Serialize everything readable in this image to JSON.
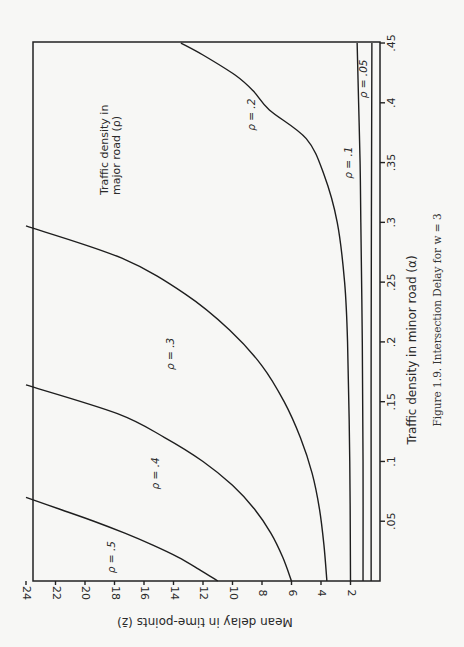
{
  "chart_data": {
    "type": "line",
    "title": "Figure 1.9. Intersection Delay for w = 3",
    "xlabel": "Traffic density in minor road (α)",
    "ylabel": "Mean delay in time-points (z̄)",
    "legend_title": "Traffic density in major road (ρ)",
    "orientation": "rotated 90° clockwise on page",
    "xlim": [
      0,
      0.45
    ],
    "ylim": [
      0,
      24
    ],
    "x_ticks": [
      ".05",
      ".1",
      ".15",
      ".2",
      ".25",
      ".3",
      ".35",
      ".4",
      ".45"
    ],
    "x_tick_values": [
      0.05,
      0.1,
      0.15,
      0.2,
      0.25,
      0.3,
      0.35,
      0.4,
      0.45
    ],
    "y_ticks": [
      "2",
      "4",
      "6",
      "8",
      "10",
      "12",
      "14",
      "16",
      "18",
      "20",
      "22",
      "24"
    ],
    "y_tick_values": [
      2,
      4,
      6,
      8,
      10,
      12,
      14,
      16,
      18,
      20,
      22,
      24
    ],
    "grid": false,
    "series": [
      {
        "name": "ρ = .5",
        "label_pos": [
          0.02,
          18
        ],
        "points": [
          [
            0,
            11.0
          ],
          [
            0.01,
            12.3
          ],
          [
            0.02,
            13.7
          ],
          [
            0.03,
            15.4
          ],
          [
            0.04,
            17.3
          ],
          [
            0.05,
            19.4
          ],
          [
            0.06,
            21.7
          ],
          [
            0.07,
            24.0
          ]
        ]
      },
      {
        "name": "ρ = .4",
        "label_pos": [
          0.09,
          15
        ],
        "points": [
          [
            0,
            6.0
          ],
          [
            0.02,
            6.6
          ],
          [
            0.04,
            7.4
          ],
          [
            0.06,
            8.5
          ],
          [
            0.08,
            10.0
          ],
          [
            0.1,
            12.0
          ],
          [
            0.12,
            14.6
          ],
          [
            0.14,
            17.8
          ],
          [
            0.164,
            24.0
          ]
        ]
      },
      {
        "name": "ρ = .3",
        "label_pos": [
          0.19,
          14
        ],
        "points": [
          [
            0,
            3.6
          ],
          [
            0.03,
            3.8
          ],
          [
            0.06,
            4.1
          ],
          [
            0.09,
            4.6
          ],
          [
            0.12,
            5.4
          ],
          [
            0.15,
            6.5
          ],
          [
            0.18,
            8.0
          ],
          [
            0.21,
            10.2
          ],
          [
            0.24,
            13.2
          ],
          [
            0.27,
            17.5
          ],
          [
            0.297,
            24.0
          ]
        ]
      },
      {
        "name": "ρ = .2",
        "label_pos": [
          0.39,
          8.5
        ],
        "points": [
          [
            0,
            2.0
          ],
          [
            0.1,
            2.05
          ],
          [
            0.2,
            2.2
          ],
          [
            0.25,
            2.4
          ],
          [
            0.3,
            2.9
          ],
          [
            0.34,
            3.8
          ],
          [
            0.37,
            5.0
          ],
          [
            0.394,
            7.5
          ],
          [
            0.41,
            8.6
          ],
          [
            0.423,
            9.8
          ],
          [
            0.44,
            12.0
          ],
          [
            0.45,
            13.5
          ]
        ]
      },
      {
        "name": "ρ = .1",
        "label_pos": [
          0.35,
          1.9
        ],
        "points": [
          [
            0,
            1.15
          ],
          [
            0.1,
            1.15
          ],
          [
            0.2,
            1.2
          ],
          [
            0.3,
            1.3
          ],
          [
            0.35,
            1.35
          ],
          [
            0.4,
            1.45
          ],
          [
            0.45,
            1.55
          ]
        ]
      },
      {
        "name": "ρ = .05",
        "label_pos": [
          0.42,
          0.9
        ],
        "points": [
          [
            0,
            0.6
          ],
          [
            0.2,
            0.6
          ],
          [
            0.45,
            0.55
          ]
        ]
      }
    ]
  },
  "figure": {
    "caption": "Figure 1.9. Intersection Delay for w = 3",
    "x_axis_label": "Traffic density in minor road (α)",
    "y_axis_label": "Mean delay in time-points (z̄)",
    "legend_line1": "Traffic density in",
    "legend_line2": "major road (ρ)"
  }
}
